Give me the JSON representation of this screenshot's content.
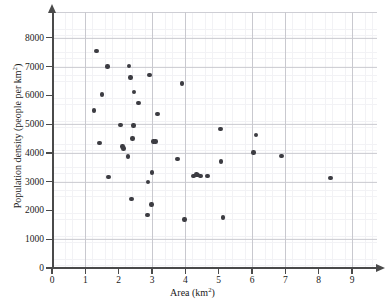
{
  "chart_data": {
    "type": "scatter",
    "title": "",
    "xlabel": "Area (km²)",
    "ylabel": "Population density (people per km²)",
    "xlabel_text": "Area (km",
    "xlabel_sup": "2",
    "xlabel_tail": ")",
    "ylabel_text": "Population density (people per km",
    "ylabel_sup": "2",
    "ylabel_tail": ")",
    "xlim": [
      0,
      9.75
    ],
    "ylim": [
      0,
      8900
    ],
    "xticks": [
      0,
      1,
      2,
      3,
      4,
      5,
      6,
      7,
      8,
      9
    ],
    "xtick_labels": [
      "0",
      "1",
      "2",
      "3",
      "4",
      "5",
      "6",
      "7",
      "8",
      "9"
    ],
    "yticks": [
      0,
      1000,
      2000,
      3000,
      4000,
      5000,
      6000,
      7000,
      8000
    ],
    "ytick_labels": [
      "0",
      "1000",
      "2000",
      "3000",
      "4000",
      "5000",
      "6000",
      "7000",
      "8000"
    ],
    "grid": true,
    "grid_major_step_x": 1,
    "grid_major_step_y": 1000,
    "grid_minor_step_x": 0.2,
    "grid_minor_step_y": 200,
    "legend": null,
    "marker": "circle",
    "marker_color": "#3c3c42",
    "grid_major_color": "#c9c9cf",
    "grid_minor_color": "#e8e8ee",
    "axis_color": "#4a4a4a",
    "background_color": "#ffffff",
    "point_count": 40,
    "points": [
      {
        "x": 1.26,
        "y": 5480
      },
      {
        "x": 1.33,
        "y": 7550
      },
      {
        "x": 1.42,
        "y": 4350
      },
      {
        "x": 1.5,
        "y": 6030
      },
      {
        "x": 1.66,
        "y": 7010
      },
      {
        "x": 1.7,
        "y": 3170
      },
      {
        "x": 2.06,
        "y": 4980
      },
      {
        "x": 2.12,
        "y": 4220
      },
      {
        "x": 2.14,
        "y": 4160
      },
      {
        "x": 2.28,
        "y": 3880
      },
      {
        "x": 2.31,
        "y": 7020
      },
      {
        "x": 2.36,
        "y": 6620
      },
      {
        "x": 2.38,
        "y": 2400
      },
      {
        "x": 2.42,
        "y": 4500
      },
      {
        "x": 2.44,
        "y": 4950
      },
      {
        "x": 2.46,
        "y": 6120
      },
      {
        "x": 2.6,
        "y": 5730
      },
      {
        "x": 2.86,
        "y": 1850
      },
      {
        "x": 2.88,
        "y": 2990
      },
      {
        "x": 2.93,
        "y": 6720
      },
      {
        "x": 2.98,
        "y": 2210
      },
      {
        "x": 3.0,
        "y": 3320
      },
      {
        "x": 3.04,
        "y": 4400
      },
      {
        "x": 3.1,
        "y": 4400
      },
      {
        "x": 3.16,
        "y": 5360
      },
      {
        "x": 3.77,
        "y": 3800
      },
      {
        "x": 3.9,
        "y": 6420
      },
      {
        "x": 3.97,
        "y": 1690
      },
      {
        "x": 4.25,
        "y": 3200
      },
      {
        "x": 4.33,
        "y": 3250
      },
      {
        "x": 4.36,
        "y": 3230
      },
      {
        "x": 4.46,
        "y": 3200
      },
      {
        "x": 4.66,
        "y": 3200
      },
      {
        "x": 5.06,
        "y": 4830
      },
      {
        "x": 5.07,
        "y": 3700
      },
      {
        "x": 5.13,
        "y": 1750
      },
      {
        "x": 6.05,
        "y": 4010
      },
      {
        "x": 6.12,
        "y": 4630
      },
      {
        "x": 6.88,
        "y": 3890
      },
      {
        "x": 8.35,
        "y": 3120
      }
    ]
  }
}
